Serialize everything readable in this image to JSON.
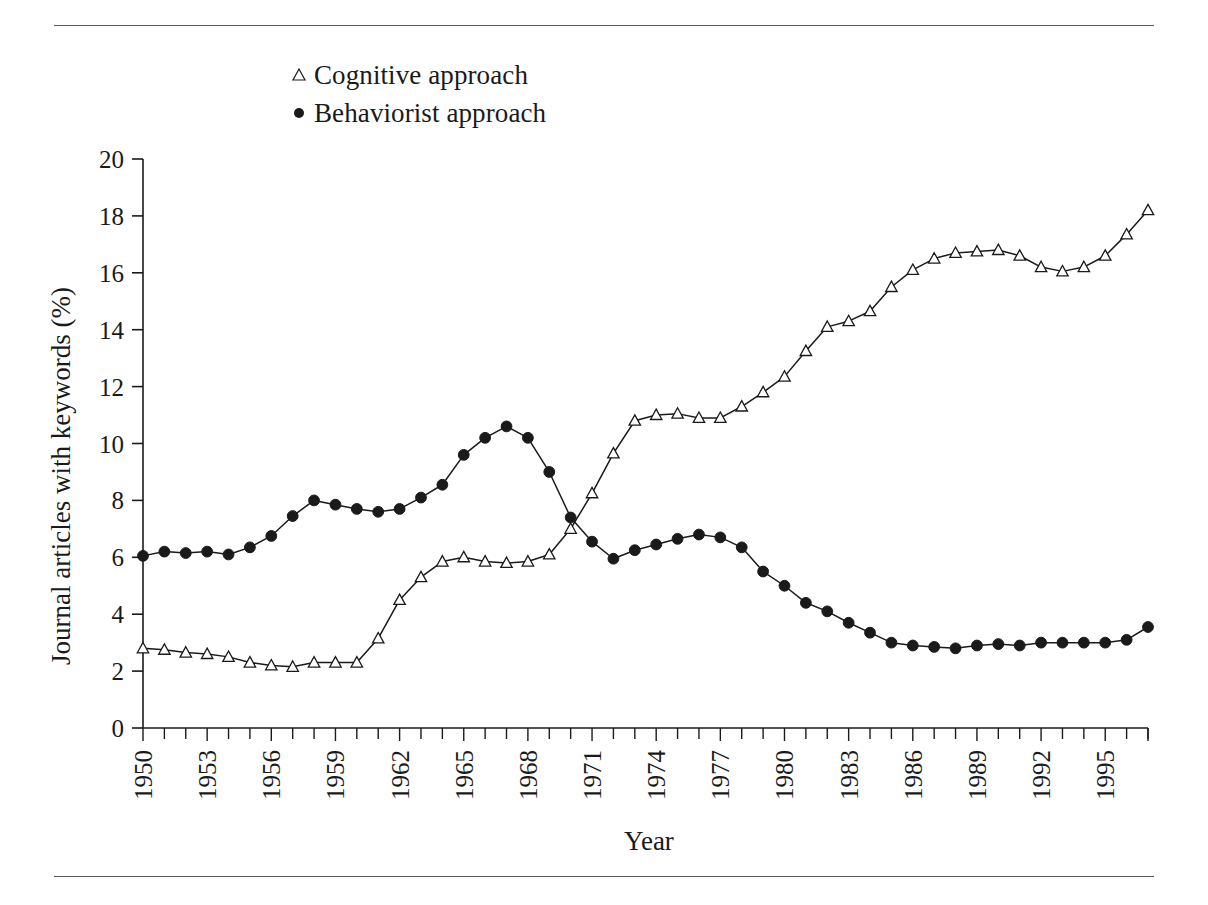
{
  "figure": {
    "background": "#ffffff",
    "ink_color": "#1a1a1a",
    "rule_color": "#555b5f",
    "top_rule": "",
    "bottom_rule": ""
  },
  "legend": {
    "position": "top-left-inside",
    "entries": [
      {
        "marker": "open-triangle",
        "label": "Cognitive approach"
      },
      {
        "marker": "filled-circle",
        "label": "Behaviorist approach"
      }
    ]
  },
  "axes": {
    "x_title": "Year",
    "y_title": "Journal articles with keywords (%)",
    "y_ticks": [
      "0",
      "2",
      "4",
      "6",
      "8",
      "10",
      "12",
      "14",
      "16",
      "18",
      "20"
    ],
    "x_ticks": [
      "1950",
      "1953",
      "1956",
      "1959",
      "1962",
      "1965",
      "1968",
      "1971",
      "1974",
      "1977",
      "1980",
      "1983",
      "1986",
      "1989",
      "1992",
      "1995"
    ],
    "x_tick_rotation_degrees": -90,
    "x_minor_tick_every_years": 1
  },
  "chart_data": {
    "type": "line",
    "title": "",
    "subtitle": "",
    "xlabel": "Year",
    "ylabel": "Journal articles with keywords (%)",
    "xlim": [
      1950,
      1997
    ],
    "ylim": [
      0,
      20
    ],
    "ytick_step": 2,
    "xtick_label_step": 3,
    "grid": false,
    "legend_position": "upper-left",
    "x": [
      1950,
      1951,
      1952,
      1953,
      1954,
      1955,
      1956,
      1957,
      1958,
      1959,
      1960,
      1961,
      1962,
      1963,
      1964,
      1965,
      1966,
      1967,
      1968,
      1969,
      1970,
      1971,
      1972,
      1973,
      1974,
      1975,
      1976,
      1977,
      1978,
      1979,
      1980,
      1981,
      1982,
      1983,
      1984,
      1985,
      1986,
      1987,
      1988,
      1989,
      1990,
      1991,
      1992,
      1993,
      1994,
      1995,
      1996,
      1997
    ],
    "series": [
      {
        "name": "Cognitive approach",
        "marker": "open-triangle",
        "color": "#1a1a1a",
        "values": [
          2.8,
          2.75,
          2.65,
          2.6,
          2.5,
          2.3,
          2.2,
          2.15,
          2.3,
          2.3,
          2.3,
          3.15,
          4.5,
          5.3,
          5.85,
          6.0,
          5.85,
          5.8,
          5.85,
          6.1,
          7.0,
          8.25,
          9.65,
          10.8,
          11.0,
          11.05,
          10.9,
          10.9,
          11.3,
          11.8,
          12.35,
          13.25,
          14.1,
          14.3,
          14.65,
          15.5,
          16.1,
          16.5,
          16.7,
          16.75,
          16.8,
          16.6,
          16.2,
          16.05,
          16.2,
          16.6,
          17.35,
          18.2
        ]
      },
      {
        "name": "Behaviorist approach",
        "marker": "filled-circle",
        "color": "#1a1a1a",
        "values": [
          6.05,
          6.2,
          6.15,
          6.2,
          6.1,
          6.35,
          6.75,
          7.45,
          8.0,
          7.85,
          7.7,
          7.6,
          7.7,
          8.1,
          8.55,
          9.6,
          10.2,
          10.6,
          10.2,
          9.0,
          7.4,
          6.55,
          5.95,
          6.25,
          6.45,
          6.65,
          6.8,
          6.7,
          6.35,
          5.5,
          5.0,
          4.4,
          4.1,
          3.7,
          3.35,
          3.0,
          2.9,
          2.85,
          2.8,
          2.9,
          2.95,
          2.9,
          3.0,
          3.0,
          3.0,
          3.0,
          3.1,
          3.55
        ]
      }
    ]
  }
}
